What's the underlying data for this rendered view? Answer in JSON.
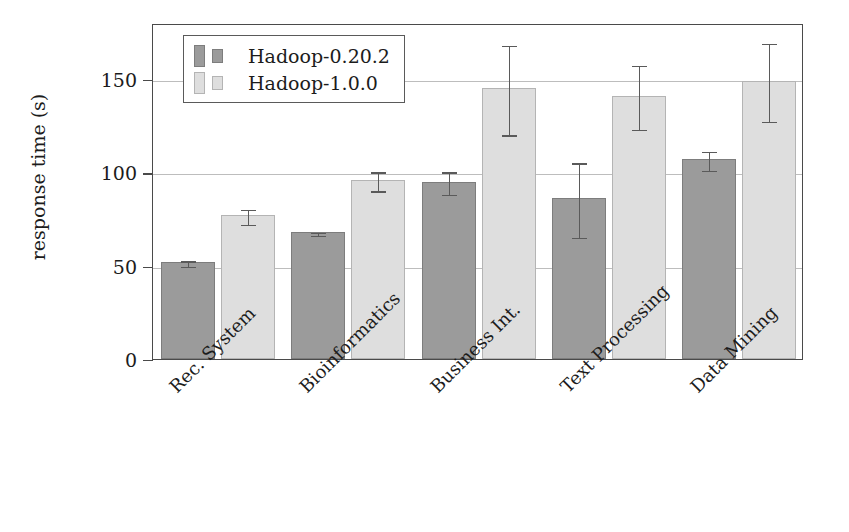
{
  "chart_data": {
    "type": "bar",
    "title": "",
    "xlabel": "",
    "ylabel": "response time (s)",
    "ylim": [
      0,
      180
    ],
    "yticks": [
      0,
      50,
      100,
      150
    ],
    "ytick_labels": [
      "0",
      "50",
      "100",
      "150"
    ],
    "grid": true,
    "legend_position": "upper left",
    "categories": [
      "Rec. System",
      "Bioinformatics",
      "Business Int.",
      "Text Processing",
      "Data Mining"
    ],
    "series": [
      {
        "name": "Hadoop-0.20.2",
        "color": "#9b9b9b",
        "values": [
          52,
          68,
          95,
          86,
          107
        ],
        "errors": [
          1.5,
          0.8,
          6,
          20,
          5
        ]
      },
      {
        "name": "Hadoop-1.0.0",
        "color": "#dedede",
        "values": [
          77,
          96,
          145,
          141,
          149
        ],
        "errors": [
          4,
          5,
          24,
          17,
          21
        ]
      }
    ]
  },
  "legend": {
    "entries": [
      {
        "label": "Hadoop-0.20.2"
      },
      {
        "label": "Hadoop-1.0.0"
      }
    ]
  }
}
